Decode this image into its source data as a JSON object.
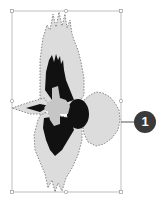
{
  "diagram": {
    "selection": {
      "state": "selected",
      "box": {
        "x": 12,
        "y": 11,
        "width": 109,
        "height": 181
      },
      "handle_color": "#9a9a9a"
    },
    "colors": {
      "body_fill": "#d9d9d9",
      "outline": "#7a7a7a",
      "dark_feathers": "#111111",
      "pale_center": "#c8c8c8"
    },
    "callouts": [
      {
        "number": "1",
        "target": "selection-right-edge",
        "badge_color": "#3a3a3a"
      }
    ]
  }
}
